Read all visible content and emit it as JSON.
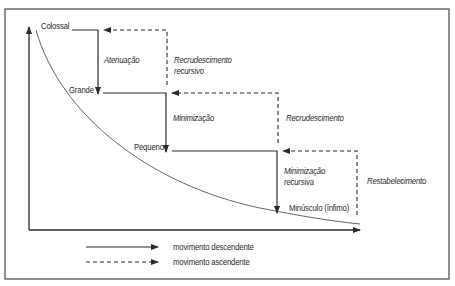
{
  "diagram": {
    "levels": [
      {
        "id": "colossal",
        "label": "Colossal"
      },
      {
        "id": "grande",
        "label": "Grande"
      },
      {
        "id": "pequeno",
        "label": "Pequeno"
      },
      {
        "id": "minusculo",
        "label": "Minúsculo (ínfimo)"
      }
    ],
    "downward_transitions": [
      {
        "from": "colossal",
        "to": "grande",
        "label": "Atenuação"
      },
      {
        "from": "grande",
        "to": "pequeno",
        "label": "Minimização"
      },
      {
        "from": "pequeno",
        "to": "minusculo",
        "label_line1": "Minimização",
        "label_line2": "recursiva"
      }
    ],
    "upward_transitions": [
      {
        "from": "grande",
        "to": "colossal",
        "label_line1": "Recrudescimento",
        "label_line2": "recursivo"
      },
      {
        "from": "pequeno",
        "to": "grande",
        "label": "Recrudescimento"
      },
      {
        "from": "minusculo",
        "to": "pequeno",
        "label": "Restabelecimento"
      }
    ],
    "legend": [
      {
        "style": "solid",
        "label": "movimento descendente"
      },
      {
        "style": "dashed",
        "label": "movimento ascendente"
      }
    ],
    "colors": {
      "line": "#2a2a2a",
      "frame": "#555555",
      "curve": "#555555",
      "background": "#ffffff"
    }
  }
}
